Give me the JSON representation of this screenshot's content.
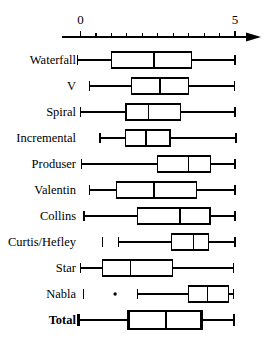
{
  "chart_data": {
    "type": "box",
    "title": "",
    "xlabel": "",
    "ylabel": "",
    "xlim": [
      -0.6,
      5.4
    ],
    "axis_ticks_labeled": [
      "0",
      "5"
    ],
    "axis_tick_values": [
      0,
      5
    ],
    "minor_tick_step": 0.5,
    "grid": false,
    "legend": null,
    "orientation": "horizontal",
    "categories": [
      "Waterfall",
      "V",
      "Spiral",
      "Incremental",
      "Produser",
      "Valentin",
      "Collins",
      "Curtis/Hefley",
      "Star",
      "Nabla",
      "Total"
    ],
    "boxes": [
      {
        "name": "Waterfall",
        "whisker_low": -0.09,
        "q1": 1.01,
        "median": 2.38,
        "q3": 3.6,
        "whisker_high": 5.0,
        "outliers": [],
        "bold": false
      },
      {
        "name": "V",
        "whisker_low": 0.29,
        "q1": 1.66,
        "median": 2.57,
        "q3": 3.49,
        "whisker_high": 4.98,
        "outliers": [],
        "bold": false
      },
      {
        "name": "Spiral",
        "whisker_low": 0.01,
        "q1": 1.47,
        "median": 2.2,
        "q3": 3.24,
        "whisker_high": 5.0,
        "outliers": [],
        "bold": false
      },
      {
        "name": "Incremental",
        "whisker_low": 0.63,
        "q1": 1.46,
        "median": 2.12,
        "q3": 2.9,
        "whisker_high": 5.03,
        "outliers": [],
        "bold": false
      },
      {
        "name": "Produser",
        "whisker_low": 0.04,
        "q1": 2.49,
        "median": 3.49,
        "q3": 4.21,
        "whisker_high": 5.0,
        "outliers": [],
        "bold": false
      },
      {
        "name": "Valentin",
        "whisker_low": 0.29,
        "q1": 1.17,
        "median": 2.38,
        "q3": 3.76,
        "whisker_high": 5.0,
        "outliers": [],
        "bold": false
      },
      {
        "name": "Collins",
        "whisker_low": 0.11,
        "q1": 1.84,
        "median": 3.22,
        "q3": 4.19,
        "whisker_high": 5.0,
        "outliers": [],
        "bold": false
      },
      {
        "name": "Curtis/Hefley",
        "whisker_low": 1.22,
        "q1": 2.95,
        "median": 3.65,
        "q3": 4.14,
        "whisker_high": 5.0,
        "outliers": [
          0.72
        ],
        "bold": false
      },
      {
        "name": "Star",
        "whisker_low": 0.01,
        "q1": 0.72,
        "median": 1.62,
        "q3": 2.98,
        "whisker_high": 4.95,
        "outliers": [],
        "bold": false
      },
      {
        "name": "Nabla",
        "whisker_low": 1.84,
        "q1": 3.49,
        "median": 4.12,
        "q3": 4.78,
        "whisker_high": 4.95,
        "outliers": [
          0.09,
          1.12
        ],
        "bold": false
      },
      {
        "name": "Total",
        "whisker_low": -0.07,
        "q1": 1.55,
        "median": 2.77,
        "q3": 3.92,
        "whisker_high": 4.97,
        "outliers": [],
        "bold": true
      }
    ]
  },
  "style": {
    "line_color": "#000000",
    "box_fill": "#ffffff",
    "background": "#ffffff"
  }
}
